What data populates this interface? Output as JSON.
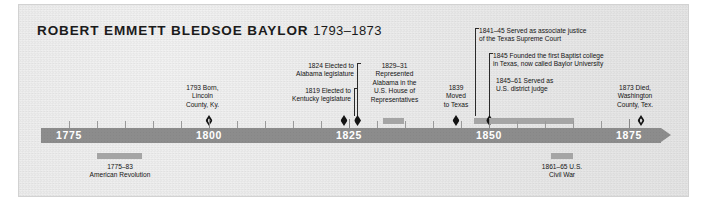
{
  "title": {
    "name": "ROBERT EMMETT BLEDSOE BAYLOR",
    "years": "1793–1873"
  },
  "axis": {
    "year_labels": [
      "1775",
      "1800",
      "1825",
      "1850",
      "1875"
    ],
    "range_start": 1770,
    "range_end": 1880
  },
  "events_above": [
    {
      "id": "born",
      "text": "1793 Born,\nLincoln\nCounty, Ky.",
      "year": 1793,
      "marker": "hollow-diamond"
    },
    {
      "id": "kentucky",
      "text": "1819 Elected to\nKentucky legislature",
      "year": 1819,
      "marker": "diamond"
    },
    {
      "id": "alabama",
      "text": "1824 Elected to\nAlabama legislature",
      "year": 1824,
      "marker": "diamond"
    },
    {
      "id": "ushouse",
      "text": "1829–31\nRepresented\nAlabama in the\nU.S. House of\nRepresentatives",
      "year_start": 1829,
      "year_end": 1831,
      "marker": "bar"
    },
    {
      "id": "texas",
      "text": "1839\nMoved\nto Texas",
      "year": 1839,
      "marker": "diamond"
    },
    {
      "id": "supremecourt",
      "text": "1841–45 Served as associate justice\nof the Texas Supreme Court",
      "year_start": 1841,
      "year_end": 1845,
      "marker": "bar"
    },
    {
      "id": "baylor",
      "text": "1845 Founded the first Baptist college\nin Texas, now called Baylor University",
      "year": 1845,
      "marker": "diamond"
    },
    {
      "id": "districtjudge",
      "text": "1845–61 Served as\nU.S. district judge",
      "year_start": 1845,
      "year_end": 1861,
      "marker": "bar"
    },
    {
      "id": "died",
      "text": "1873 Died,\nWashington\nCounty, Tex.",
      "year": 1873,
      "marker": "hollow-diamond"
    }
  ],
  "events_below": [
    {
      "id": "revolution",
      "text": "1775–83\nAmerican Revolution",
      "year_start": 1775,
      "year_end": 1783,
      "marker": "bar"
    },
    {
      "id": "civilwar",
      "text": "1861–65 U.S.\nCivil War",
      "year_start": 1861,
      "year_end": 1865,
      "marker": "bar"
    }
  ],
  "colors": {
    "axis": "#8c8c8c",
    "marker": "#141414",
    "span": "#a5a5a5",
    "background": "#e9e9e9",
    "year_label": "#ffffff"
  }
}
